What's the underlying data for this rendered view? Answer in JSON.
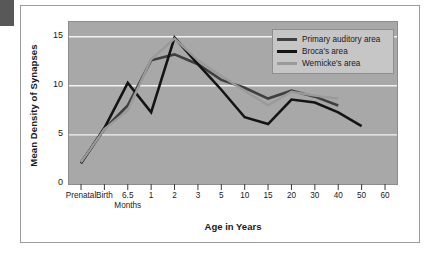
{
  "figure": {
    "corner_tab": "corner-tab",
    "background_color": "#ffffff",
    "panel_color": "#a8a8a8"
  },
  "chart_data": {
    "type": "line",
    "title": "",
    "subtitle": "",
    "xlabel": "Age in Years",
    "ylabel": "Mean Density of Synapses",
    "grid": true,
    "legend_position": "top-right",
    "ylim": [
      0,
      16.5
    ],
    "yticks": [
      0,
      5,
      10,
      15
    ],
    "ytick_labels": [
      "0",
      "5",
      "10",
      "15"
    ],
    "categories": [
      "Prenatal",
      "Birth",
      "6.5",
      "1",
      "2",
      "3",
      "5",
      "10",
      "15",
      "20",
      "30",
      "40",
      "50",
      "60"
    ],
    "xtick_labels": [
      "Prenatal",
      "Birth",
      "6.5",
      "1",
      "2",
      "3",
      "5",
      "10",
      "15",
      "20",
      "30",
      "40",
      "50",
      "60"
    ],
    "xtick_sublabel": "Months",
    "xtick_sublabel_under": "6.5",
    "series": [
      {
        "name": "Primary auditory area",
        "color": "#3f3f3f",
        "values": [
          2.2,
          5.6,
          8.0,
          12.6,
          13.2,
          12.2,
          10.6,
          9.8,
          8.7,
          9.5,
          8.9,
          8.0,
          null,
          null
        ]
      },
      {
        "name": "Broca's area",
        "color": "#141414",
        "values": [
          2.1,
          5.7,
          10.3,
          7.3,
          14.9,
          12.2,
          9.6,
          6.8,
          6.1,
          8.6,
          8.3,
          7.3,
          5.9,
          null
        ]
      },
      {
        "name": "Wernicke's area",
        "color": "#9a9a9a",
        "values": [
          2.2,
          5.6,
          7.5,
          12.7,
          14.8,
          12.6,
          11.0,
          9.5,
          8.0,
          9.4,
          9.0,
          8.7,
          null,
          null
        ]
      }
    ]
  }
}
